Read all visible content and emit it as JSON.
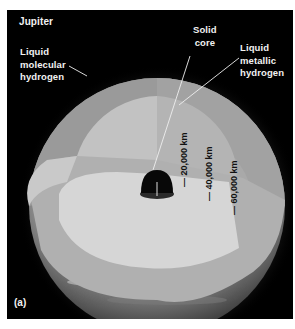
{
  "figure": {
    "title": "Jupiter",
    "panel_label": "(a)",
    "labels": {
      "molecular_hydrogen": "Liquid\nmolecular\nhydrogen",
      "solid_core": "Solid\ncore",
      "metallic_hydrogen": "Liquid\nmetallic\nhydrogen"
    },
    "distances": [
      {
        "label": "— 20,000 km"
      },
      {
        "label": "— 40,000 km"
      },
      {
        "label": "— 60,000 km"
      }
    ],
    "colors": {
      "background": "#000000",
      "molecular_layer": "#9a9a9a",
      "metallic_layer": "#c4c4c4",
      "core": "#0a0a0a",
      "atmosphere": "#8c8c8c"
    }
  }
}
